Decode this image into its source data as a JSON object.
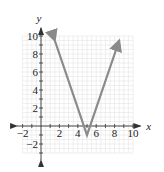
{
  "chart_data": {
    "type": "line",
    "title": "",
    "xlabel": "x",
    "ylabel": "y",
    "xlim": [
      -2,
      10
    ],
    "ylim": [
      -3,
      10
    ],
    "grid": true,
    "x_ticks": [
      -2,
      2,
      4,
      6,
      8,
      10
    ],
    "y_ticks": [
      10,
      8,
      6,
      4,
      2,
      -2
    ],
    "series": [
      {
        "name": "y = 3|x - 5| - 1",
        "x": [
          1.5,
          5,
          8.5
        ],
        "y": [
          9.5,
          -1,
          9.5
        ],
        "arrows_at_ends": true
      }
    ],
    "colors": {
      "line": "#8a8a8a",
      "grid": "#e4e4e4",
      "axis": "#333333"
    }
  }
}
